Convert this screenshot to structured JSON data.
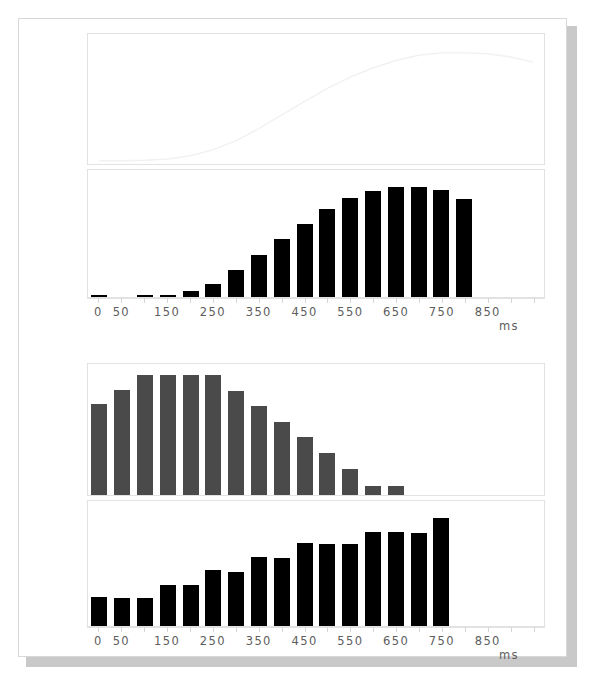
{
  "figure": {
    "background": "#ffffff",
    "paper_border": "#d8d8d8",
    "shadow_color": "#c9c9c9",
    "axis_color": "#e2e2e2",
    "tick_text_color": "#5d5d5d",
    "bar_black": "#000000",
    "bar_gray": "#4a4a4a",
    "curve_color": "#f1f1f1"
  },
  "axis": {
    "ytick_labels": [
      "0,00",
      "2,00",
      "4,00",
      "6,00",
      "8,00"
    ],
    "ytick_values": [
      0,
      2,
      4,
      6,
      8
    ],
    "ylim": [
      0,
      8.6
    ],
    "xtick_labels": [
      "0",
      "50",
      "150",
      "250",
      "350",
      "450",
      "550",
      "650",
      "750",
      "850"
    ],
    "xtick_values": [
      0,
      50,
      150,
      250,
      350,
      450,
      550,
      650,
      750,
      850
    ],
    "xlim": [
      -25,
      975
    ],
    "unit_label": "ms"
  },
  "chart_data": [
    {
      "id": "panel-1",
      "type": "line",
      "title": "",
      "xlabel": "",
      "ylabel": "",
      "ylim": [
        0,
        8.6
      ],
      "xlim": [
        -25,
        975
      ],
      "grid": false,
      "ytick_labels": [
        "0,00",
        "2,00",
        "4,00",
        "6,00",
        "8,00"
      ],
      "series": [
        {
          "name": "cumulative-curve",
          "color": "#f1f1f1",
          "x": [
            0,
            50,
            100,
            150,
            200,
            250,
            300,
            350,
            400,
            450,
            500,
            550,
            600,
            650,
            700,
            750,
            800,
            850,
            900,
            950
          ],
          "values": [
            0.22,
            0.22,
            0.25,
            0.33,
            0.55,
            0.95,
            1.55,
            2.35,
            3.25,
            4.15,
            5.0,
            5.75,
            6.35,
            6.85,
            7.2,
            7.35,
            7.35,
            7.3,
            7.1,
            6.75
          ]
        }
      ]
    },
    {
      "id": "panel-2",
      "type": "bar",
      "title": "",
      "xlabel": "ms",
      "ylabel": "",
      "ylim": [
        0,
        8.6
      ],
      "xlim": [
        -25,
        975
      ],
      "grid": false,
      "color": "#000000",
      "categories": [
        0,
        50,
        100,
        150,
        200,
        250,
        300,
        350,
        400,
        450,
        500,
        550,
        600,
        650,
        700,
        750,
        800,
        850,
        900,
        950
      ],
      "values": [
        0.12,
        0.0,
        0.1,
        0.16,
        0.42,
        0.88,
        1.8,
        2.85,
        3.95,
        4.95,
        5.95,
        6.7,
        7.15,
        7.45,
        7.45,
        7.25,
        6.65
      ]
    },
    {
      "id": "panel-3",
      "type": "bar",
      "title": "",
      "xlabel": "",
      "ylabel": "",
      "ylim": [
        0,
        8.6
      ],
      "xlim": [
        -25,
        975
      ],
      "grid": false,
      "color": "#4a4a4a",
      "categories": [
        0,
        50,
        100,
        150,
        200,
        250,
        300,
        350,
        400,
        450,
        500,
        550,
        600,
        650
      ],
      "values": [
        5.95,
        6.9,
        7.9,
        7.85,
        7.85,
        7.85,
        6.8,
        5.85,
        4.8,
        3.8,
        2.75,
        1.7,
        0.6,
        0.6
      ]
    },
    {
      "id": "panel-4",
      "type": "bar",
      "title": "",
      "xlabel": "ms",
      "ylabel": "",
      "ylim": [
        0,
        8.6
      ],
      "xlim": [
        -25,
        975
      ],
      "grid": false,
      "color": "#000000",
      "categories": [
        0,
        50,
        100,
        150,
        200,
        250,
        300,
        350,
        400,
        450,
        500,
        550,
        600,
        650,
        700,
        750,
        800,
        850,
        900
      ],
      "values": [
        2.0,
        1.9,
        1.9,
        2.85,
        2.8,
        3.85,
        3.75,
        4.75,
        4.7,
        5.7,
        5.65,
        5.65,
        6.5,
        6.45,
        6.4,
        7.45
      ]
    }
  ]
}
